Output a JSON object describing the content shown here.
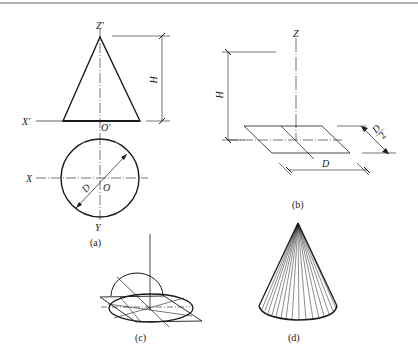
{
  "figure": {
    "colors": {
      "ink": "#1a1a1a",
      "border": "#6a6a6a",
      "background": "#ffffff"
    },
    "panels": [
      {
        "id": "a",
        "caption": "(a)",
        "front_view": {
          "apex_label": "Z'",
          "origin_label": "O'",
          "axis_label": "X'",
          "dimension_height": "H"
        },
        "top_view": {
          "x_label": "X",
          "y_label": "Y",
          "origin_label": "O",
          "diameter_label": "D"
        }
      },
      {
        "id": "b",
        "caption": "(b)",
        "labels": {
          "z_axis": "Z",
          "height": "H",
          "diameter": "D",
          "half_diameter": "D/2",
          "half_num": "D",
          "half_den": "2"
        }
      },
      {
        "id": "c",
        "caption": "(c)"
      },
      {
        "id": "d",
        "caption": "(d)"
      }
    ]
  }
}
